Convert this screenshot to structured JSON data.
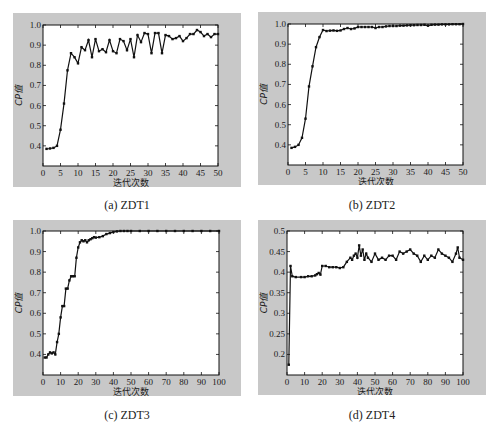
{
  "figure": {
    "captions": [
      "(a) ZDT1",
      "(b) ZDT2",
      "(c)  ZDT3",
      "(d) ZDT4"
    ]
  },
  "colors": {
    "panel_bg": "#c8c8c8",
    "plot_bg": "#ffffff",
    "line": "#111111",
    "text": "#1a1a1a"
  },
  "chart_data": [
    {
      "type": "line",
      "title": "(a) ZDT1",
      "xlabel": "迭代次数",
      "ylabel": "CP值",
      "xlim": [
        0,
        50
      ],
      "ylim": [
        0.3,
        1.0
      ],
      "xticks": [
        0,
        5,
        10,
        15,
        20,
        25,
        30,
        35,
        40,
        45,
        50
      ],
      "yticks": [
        0.4,
        0.5,
        0.6,
        0.7,
        0.8,
        0.9,
        1.0
      ],
      "ytick_labels": [
        "0.4",
        "0.5",
        "0.6",
        "0.7",
        "0.8",
        "0.9",
        "1.0"
      ],
      "grid": false,
      "markers": true,
      "x": [
        1,
        2,
        3,
        4,
        5,
        6,
        7,
        8,
        9,
        10,
        11,
        12,
        13,
        14,
        15,
        16,
        17,
        18,
        19,
        20,
        21,
        22,
        23,
        24,
        25,
        26,
        27,
        28,
        29,
        30,
        31,
        32,
        33,
        34,
        35,
        36,
        37,
        38,
        39,
        40,
        41,
        42,
        43,
        44,
        45,
        46,
        47,
        48,
        49,
        50
      ],
      "values": [
        0.385,
        0.387,
        0.39,
        0.4,
        0.48,
        0.61,
        0.775,
        0.86,
        0.84,
        0.81,
        0.89,
        0.875,
        0.925,
        0.84,
        0.93,
        0.87,
        0.88,
        0.865,
        0.925,
        0.87,
        0.86,
        0.93,
        0.92,
        0.875,
        0.93,
        0.84,
        0.95,
        0.915,
        0.96,
        0.955,
        0.86,
        0.96,
        0.96,
        0.86,
        0.95,
        0.945,
        0.93,
        0.935,
        0.945,
        0.92,
        0.935,
        0.955,
        0.955,
        0.975,
        0.965,
        0.945,
        0.955,
        0.94,
        0.955,
        0.955
      ]
    },
    {
      "type": "line",
      "title": "(b) ZDT2",
      "xlabel": "迭代次数",
      "ylabel": "CP值",
      "xlim": [
        0,
        50
      ],
      "ylim": [
        0.3,
        1.0
      ],
      "xticks": [
        0,
        5,
        10,
        15,
        20,
        25,
        30,
        35,
        40,
        45,
        50
      ],
      "yticks": [
        0.4,
        0.5,
        0.6,
        0.7,
        0.8,
        0.9,
        1.0
      ],
      "ytick_labels": [
        "0.4",
        "0.5",
        "0.6",
        "0.7",
        "0.8",
        "0.9",
        "1.0"
      ],
      "grid": false,
      "markers": true,
      "x": [
        1,
        2,
        3,
        4,
        5,
        6,
        7,
        8,
        9,
        10,
        11,
        12,
        13,
        14,
        15,
        16,
        17,
        18,
        19,
        20,
        21,
        22,
        23,
        24,
        25,
        26,
        27,
        28,
        29,
        30,
        31,
        32,
        33,
        34,
        35,
        36,
        37,
        38,
        39,
        40,
        41,
        42,
        43,
        44,
        45,
        46,
        47,
        48,
        49,
        50
      ],
      "values": [
        0.385,
        0.39,
        0.4,
        0.435,
        0.53,
        0.69,
        0.79,
        0.885,
        0.935,
        0.97,
        0.965,
        0.967,
        0.968,
        0.966,
        0.968,
        0.975,
        0.98,
        0.975,
        0.978,
        0.985,
        0.985,
        0.985,
        0.985,
        0.985,
        0.98,
        0.985,
        0.985,
        0.988,
        0.99,
        0.99,
        0.99,
        0.992,
        0.992,
        0.993,
        0.994,
        0.994,
        0.995,
        0.995,
        0.996,
        0.992,
        0.996,
        0.997,
        0.997,
        0.998,
        0.998,
        0.998,
        0.999,
        0.999,
        0.999,
        1.0
      ]
    },
    {
      "type": "line",
      "title": "(c) ZDT3",
      "xlabel": "迭代次数",
      "ylabel": "CP值",
      "xlim": [
        0,
        100
      ],
      "ylim": [
        0.3,
        1.0
      ],
      "xticks": [
        0,
        10,
        20,
        30,
        40,
        50,
        60,
        70,
        80,
        90,
        100
      ],
      "yticks": [
        0.4,
        0.5,
        0.6,
        0.7,
        0.8,
        0.9,
        1.0
      ],
      "ytick_labels": [
        "0.4",
        "0.5",
        "0.6",
        "0.7",
        "0.8",
        "0.9",
        "1.0"
      ],
      "grid": false,
      "markers": true,
      "x": [
        1,
        2,
        3,
        4,
        5,
        6,
        7,
        8,
        9,
        10,
        11,
        12,
        13,
        14,
        15,
        16,
        17,
        18,
        19,
        20,
        21,
        22,
        23,
        24,
        25,
        26,
        27,
        28,
        29,
        30,
        32,
        34,
        36,
        38,
        40,
        42,
        44,
        46,
        48,
        50,
        55,
        60,
        65,
        70,
        75,
        80,
        85,
        90,
        95,
        100
      ],
      "values": [
        0.385,
        0.385,
        0.4,
        0.41,
        0.405,
        0.41,
        0.4,
        0.46,
        0.5,
        0.58,
        0.635,
        0.635,
        0.72,
        0.72,
        0.76,
        0.78,
        0.78,
        0.78,
        0.87,
        0.92,
        0.945,
        0.955,
        0.95,
        0.955,
        0.945,
        0.955,
        0.96,
        0.965,
        0.97,
        0.968,
        0.97,
        0.975,
        0.985,
        0.99,
        0.995,
        0.998,
        1.0,
        1.0,
        1.0,
        1.0,
        1.0,
        1.0,
        1.0,
        1.0,
        1.0,
        1.0,
        1.0,
        1.0,
        1.0,
        1.0
      ]
    },
    {
      "type": "line",
      "title": "(d) ZDT4",
      "xlabel": "迭代次数",
      "ylabel": "CP值",
      "xlim": [
        0,
        100
      ],
      "ylim": [
        0.15,
        0.5
      ],
      "xticks": [
        0,
        10,
        20,
        30,
        40,
        50,
        60,
        70,
        80,
        90,
        100
      ],
      "yticks": [
        0.2,
        0.25,
        0.3,
        0.35,
        0.4,
        0.45,
        0.5
      ],
      "ytick_labels": [
        "0.2",
        "0.25",
        "0.3",
        "0.35",
        "0.4",
        "0.45",
        "0.5"
      ],
      "grid": false,
      "markers": true,
      "x": [
        1,
        2,
        3,
        5,
        8,
        10,
        12,
        14,
        16,
        17,
        18,
        19,
        20,
        22,
        24,
        26,
        28,
        30,
        32,
        34,
        36,
        37,
        38,
        39,
        40,
        41,
        42,
        43,
        44,
        45,
        46,
        48,
        50,
        52,
        54,
        56,
        58,
        60,
        62,
        64,
        66,
        68,
        70,
        72,
        74,
        76,
        78,
        80,
        82,
        84,
        86,
        88,
        90,
        92,
        94,
        96,
        97,
        98,
        100
      ],
      "values": [
        0.175,
        0.415,
        0.39,
        0.388,
        0.388,
        0.388,
        0.39,
        0.39,
        0.392,
        0.395,
        0.398,
        0.394,
        0.415,
        0.415,
        0.412,
        0.412,
        0.412,
        0.41,
        0.412,
        0.425,
        0.435,
        0.43,
        0.44,
        0.445,
        0.435,
        0.465,
        0.44,
        0.455,
        0.43,
        0.445,
        0.435,
        0.425,
        0.445,
        0.43,
        0.435,
        0.43,
        0.44,
        0.44,
        0.43,
        0.45,
        0.445,
        0.45,
        0.455,
        0.445,
        0.44,
        0.425,
        0.44,
        0.43,
        0.44,
        0.435,
        0.455,
        0.445,
        0.44,
        0.435,
        0.425,
        0.445,
        0.46,
        0.435,
        0.43
      ]
    }
  ]
}
